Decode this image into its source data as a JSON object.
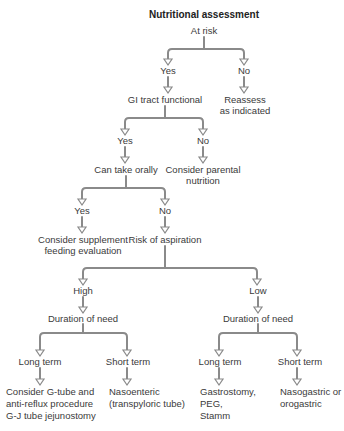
{
  "diagram": {
    "title": "Nutritional assessment",
    "line_color": "#8a8a8a",
    "text_color": "#3a3a3a",
    "nodes": {
      "at_risk": "At risk",
      "at_risk_yes": "Yes",
      "at_risk_no": "No",
      "gi_tract": "GI tract functional",
      "reassess_1": "Reassess",
      "reassess_2": "as indicated",
      "gi_yes": "Yes",
      "gi_no": "No",
      "can_take_orally": "Can take orally",
      "parental_1": "Consider parental",
      "parental_2": "nutrition",
      "oral_yes": "Yes",
      "oral_no": "No",
      "supplement_1": "Consider supplement",
      "supplement_2": "feeding evaluation",
      "risk_aspiration": "Risk of aspiration",
      "high": "High",
      "low": "Low",
      "duration_high": "Duration of need",
      "duration_low": "Duration of need",
      "high_long": "Long term",
      "high_short": "Short term",
      "low_long": "Long term",
      "low_short": "Short term",
      "high_long_out_1": "Consider G-tube and",
      "high_long_out_2": "anti-reflux procedure",
      "high_long_out_3": "G-J tube jejunostomy",
      "high_short_out_1": "Nasoenteric",
      "high_short_out_2": "(transpyloric tube)",
      "low_long_out_1": "Gastrostomy,",
      "low_long_out_2": "PEG,",
      "low_long_out_3": "Stamm",
      "low_short_out_1": "Nasogastric or",
      "low_short_out_2": "orogastric"
    }
  }
}
